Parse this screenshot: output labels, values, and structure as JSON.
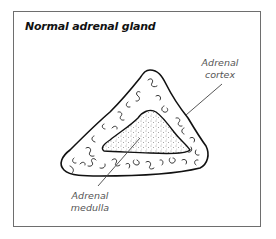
{
  "figure": {
    "title": "Normal adrenal gland",
    "labels": {
      "cortex_line1": "Adrenal",
      "cortex_line2": "cortex",
      "medulla_line1": "Adrenal",
      "medulla_line2": "medulla"
    },
    "colors": {
      "frame": "#6e6e6e",
      "outline": "#111111",
      "label_text": "#555555",
      "leader_line": "#444444"
    }
  }
}
